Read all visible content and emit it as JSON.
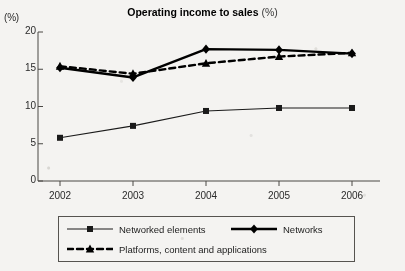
{
  "chart_data": {
    "type": "line",
    "title": "Operating income to sales",
    "title_unit": "(%)",
    "ylabel": "(%)",
    "xlabel": "",
    "categories": [
      "2002",
      "2003",
      "2004",
      "2005",
      "2006"
    ],
    "x": [
      2002,
      2003,
      2004,
      2005,
      2006
    ],
    "ylim": [
      0,
      20
    ],
    "yticks": [
      "0",
      "5",
      "10",
      "15",
      "20"
    ],
    "ytick_values": [
      0,
      5,
      10,
      15,
      20
    ],
    "grid": false,
    "legend_position": "bottom",
    "series": [
      {
        "name": "Networked elements",
        "values": [
          5.8,
          7.4,
          9.4,
          9.8,
          9.8
        ],
        "marker": "square",
        "line_style": "solid",
        "line_weight": "thin",
        "color": "#1a1a1a"
      },
      {
        "name": "Networks",
        "values": [
          15.2,
          13.9,
          17.7,
          17.6,
          17.1
        ],
        "marker": "diamond",
        "line_style": "solid",
        "line_weight": "thick",
        "color": "#000000"
      },
      {
        "name": "Platforms, content and applications",
        "values": [
          15.4,
          14.4,
          15.8,
          16.7,
          17.2
        ],
        "marker": "triangle",
        "line_style": "dashed",
        "line_weight": "thick",
        "color": "#000000"
      }
    ]
  },
  "legend": {
    "entries": [
      {
        "label": "Networked elements"
      },
      {
        "label": "Networks"
      },
      {
        "label": "Platforms, content and applications"
      }
    ]
  }
}
